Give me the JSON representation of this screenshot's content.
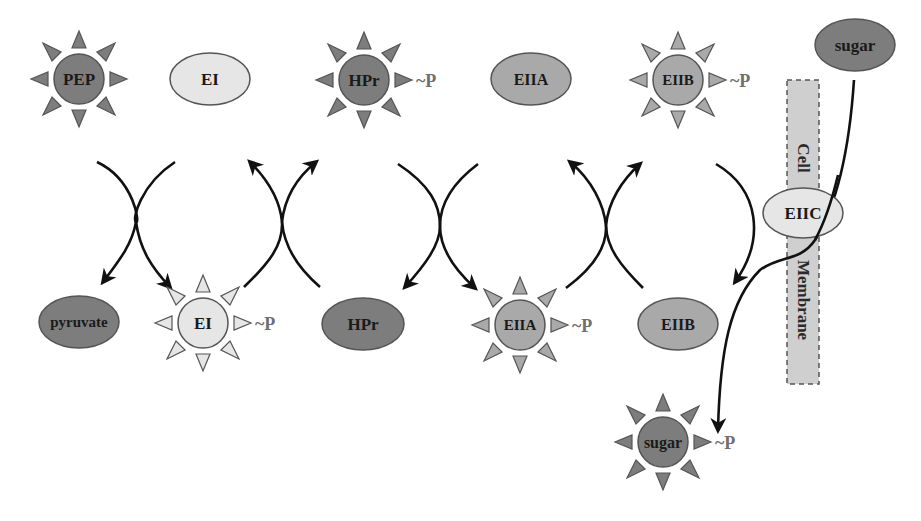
{
  "diagram": {
    "colors": {
      "dark": "#7d7d7d",
      "medium": "#a9a9a9",
      "light": "#e6e6e6",
      "membrane": "#cfcfcf",
      "arrow": "#111111",
      "phospho_label": "#6f6f6f"
    },
    "membrane": {
      "top_label": "Cell",
      "bottom_label": "Membrane"
    },
    "phospho_suffix": "~P",
    "nodes": {
      "pep": {
        "label": "PEP",
        "phosphorylated": true,
        "shade": "dark"
      },
      "ei_top": {
        "label": "EI",
        "phosphorylated": false,
        "shade": "light"
      },
      "hpr_top": {
        "label": "HPr",
        "phosphorylated": true,
        "shade": "dark"
      },
      "eiia_top": {
        "label": "EIIA",
        "phosphorylated": false,
        "shade": "medium"
      },
      "eiib_top": {
        "label": "EIIB",
        "phosphorylated": true,
        "shade": "medium"
      },
      "sugar_out": {
        "label": "sugar",
        "phosphorylated": false,
        "shade": "dark"
      },
      "eiic": {
        "label": "EIIC",
        "phosphorylated": false,
        "shade": "light"
      },
      "pyruvate": {
        "label": "pyruvate",
        "phosphorylated": false,
        "shade": "dark"
      },
      "ei_bottom": {
        "label": "EI",
        "phosphorylated": true,
        "shade": "light"
      },
      "hpr_bottom": {
        "label": "HPr",
        "phosphorylated": false,
        "shade": "dark"
      },
      "eiia_bottom": {
        "label": "EIIA",
        "phosphorylated": true,
        "shade": "medium"
      },
      "eiib_bottom": {
        "label": "EIIB",
        "phosphorylated": false,
        "shade": "medium"
      },
      "sugar_in": {
        "label": "sugar",
        "phosphorylated": true,
        "shade": "dark"
      }
    },
    "transfers": [
      {
        "from": "PEP",
        "to": "pyruvate"
      },
      {
        "from": "EI",
        "to": "EI~P"
      },
      {
        "from": "EI~P",
        "to": "EI"
      },
      {
        "from": "HPr",
        "to": "HPr~P"
      },
      {
        "from": "HPr~P",
        "to": "HPr"
      },
      {
        "from": "EIIA",
        "to": "EIIA~P"
      },
      {
        "from": "EIIA~P",
        "to": "EIIA"
      },
      {
        "from": "EIIB",
        "to": "EIIB~P"
      },
      {
        "from": "EIIB~P",
        "to": "EIIB"
      },
      {
        "from": "sugar (outside)",
        "to": "sugar~P (inside)",
        "via": "EIIC"
      }
    ]
  }
}
